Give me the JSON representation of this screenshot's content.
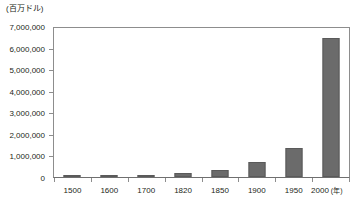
{
  "chart_data": {
    "type": "bar",
    "title": "",
    "subtitle": "",
    "unit_label": "(百万ドル)",
    "xlabel": "(年)",
    "ylabel": "",
    "categories": [
      "1500",
      "1600",
      "1700",
      "1820",
      "1850",
      "1900",
      "1950",
      "2000"
    ],
    "values": [
      50000,
      75000,
      100000,
      175000,
      350000,
      700000,
      1350000,
      6500000
    ],
    "ylim": [
      0,
      7000000
    ],
    "ytick_values": [
      0,
      1000000,
      2000000,
      3000000,
      4000000,
      5000000,
      6000000,
      7000000
    ],
    "ytick_labels": [
      "0",
      "1,000,000",
      "2,000,000",
      "3,000,000",
      "4,000,000",
      "5,000,000",
      "6,000,000",
      "7,000,000"
    ],
    "grid": false,
    "legend": null,
    "bar_color": "#6b6b6b",
    "axis_color": "#8d8d8d"
  }
}
